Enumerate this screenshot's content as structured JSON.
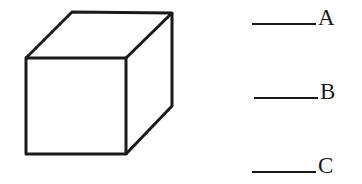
{
  "figure": {
    "shape": "cube",
    "stroke_color": "#1a1a1a"
  },
  "options": [
    {
      "label": "A",
      "blank": "_____"
    },
    {
      "label": "B",
      "blank": "_____"
    },
    {
      "label": "C",
      "blank": "_____"
    }
  ]
}
